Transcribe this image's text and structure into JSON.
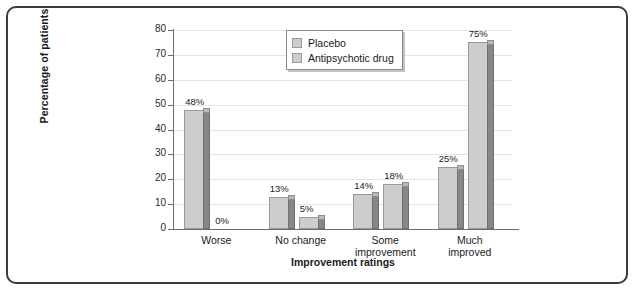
{
  "chart_data": {
    "type": "bar",
    "title": "",
    "xlabel": "Improvement ratings",
    "ylabel": "Percentage of patients",
    "categories": [
      "Worse",
      "No change",
      "Some improvement",
      "Much improved"
    ],
    "category_lines": [
      [
        "Worse"
      ],
      [
        "No change"
      ],
      [
        "Some",
        "improvement"
      ],
      [
        "Much",
        "improved"
      ]
    ],
    "series": [
      {
        "name": "Placebo",
        "values": [
          48,
          13,
          14,
          25
        ],
        "labels": [
          "48%",
          "13%",
          "14%",
          "25%"
        ]
      },
      {
        "name": "Antipsychotic drug",
        "values": [
          0,
          5,
          18,
          75
        ],
        "labels": [
          "0%",
          "5%",
          "18%",
          "75%"
        ]
      }
    ],
    "ylim": [
      0,
      80
    ],
    "yticks": [
      0,
      10,
      20,
      30,
      40,
      50,
      60,
      70,
      80
    ],
    "ytick_labels": [
      "0",
      "10",
      "20",
      "30",
      "40",
      "50",
      "60",
      "70",
      "80"
    ],
    "grid": "horizontal",
    "legend_position": "top-center",
    "style": "3d-bar",
    "colors": {
      "bar_face": "#cdcdcd",
      "bar_side": "#878787",
      "bar_top": "#b9b9b9",
      "bar_edge": "#9a9a9a",
      "gridline": "#e4e4e4",
      "axis": "#6d6d6d",
      "text": "#1a1a1a",
      "frame": "#3a3a3a",
      "background": "#ffffff"
    }
  },
  "legend": {
    "items": [
      {
        "label": "Placebo"
      },
      {
        "label": "Antipsychotic drug"
      }
    ]
  }
}
